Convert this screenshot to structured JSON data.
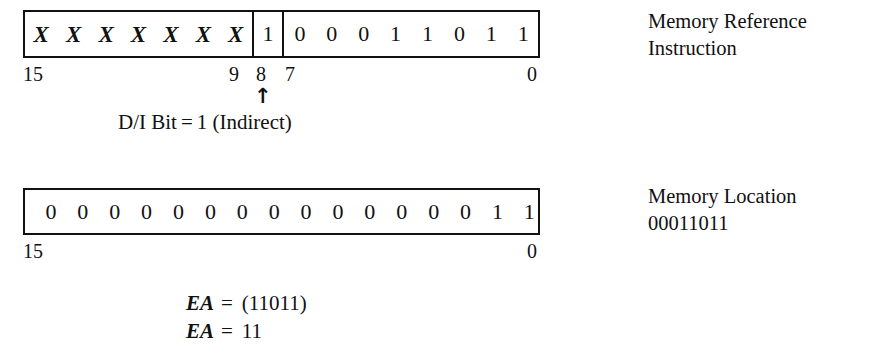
{
  "figure": {
    "title_not_shown": "",
    "instruction_row": {
      "opcode_bits": [
        "X",
        "X",
        "X",
        "X",
        "X",
        "X",
        "X"
      ],
      "di_bit": "1",
      "address_bits": [
        "0",
        "0",
        "0",
        "1",
        "1",
        "0",
        "1",
        "1"
      ],
      "bit_labels": {
        "msb": "15",
        "opcode_lsb": "9",
        "di": "8",
        "address_msb": "7",
        "lsb": "0"
      },
      "arrow_glyph": "↑",
      "caption": {
        "label": "D/I Bit",
        "equals": "=",
        "value": "1",
        "note": "(Indirect)"
      },
      "annotation_line1": "Memory Reference",
      "annotation_line2": "Instruction"
    },
    "memory_row": {
      "bits": [
        "0",
        "0",
        "0",
        "0",
        "0",
        "0",
        "0",
        "0",
        "0",
        "0",
        "0",
        "0",
        "0",
        "0",
        "1",
        "1"
      ],
      "bit_labels": {
        "msb": "15",
        "lsb": "0"
      },
      "annotation_line1": "Memory Location",
      "annotation_line2": "00011011"
    },
    "effective_address": {
      "line1": {
        "symbol": "EA",
        "operator": "=",
        "value": "(11011)"
      },
      "line2": {
        "symbol": "EA",
        "operator": "=",
        "value": "11"
      }
    },
    "colors": {
      "ink": "#111111",
      "paper": "#ffffff"
    }
  }
}
